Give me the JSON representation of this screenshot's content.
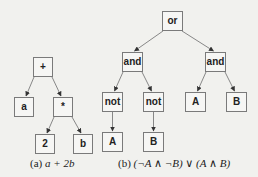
{
  "figure": {
    "subfigures": [
      {
        "id": "a",
        "caption_label": "(a)",
        "caption_expr": "a + 2b",
        "nodes": [
          {
            "id": "plus",
            "label": "+",
            "x": 33,
            "y": 57
          },
          {
            "id": "a",
            "label": "a",
            "x": 14,
            "y": 97
          },
          {
            "id": "mul",
            "label": "*",
            "x": 53,
            "y": 97
          },
          {
            "id": "two",
            "label": "2",
            "x": 35,
            "y": 134
          },
          {
            "id": "b",
            "label": "b",
            "x": 73,
            "y": 134
          }
        ],
        "edges": [
          [
            "plus",
            "a"
          ],
          [
            "plus",
            "mul"
          ],
          [
            "mul",
            "two"
          ],
          [
            "mul",
            "b"
          ]
        ]
      },
      {
        "id": "b",
        "caption_label": "(b)",
        "caption_expr": "(¬A ∧ ¬B) ∨ (A ∧ B)",
        "nodes": [
          {
            "id": "or",
            "label": "or",
            "x": 162,
            "y": 11
          },
          {
            "id": "and1",
            "label": "and",
            "x": 122,
            "y": 52
          },
          {
            "id": "and2",
            "label": "and",
            "x": 205,
            "y": 52
          },
          {
            "id": "not1",
            "label": "not",
            "x": 102,
            "y": 92
          },
          {
            "id": "not2",
            "label": "not",
            "x": 143,
            "y": 92
          },
          {
            "id": "A2",
            "label": "A",
            "x": 185,
            "y": 92
          },
          {
            "id": "B2",
            "label": "B",
            "x": 226,
            "y": 92
          },
          {
            "id": "A1",
            "label": "A",
            "x": 102,
            "y": 132
          },
          {
            "id": "B1",
            "label": "B",
            "x": 143,
            "y": 132
          }
        ],
        "edges": [
          [
            "or",
            "and1"
          ],
          [
            "or",
            "and2"
          ],
          [
            "and1",
            "not1"
          ],
          [
            "and1",
            "not2"
          ],
          [
            "and2",
            "A2"
          ],
          [
            "and2",
            "B2"
          ],
          [
            "not1",
            "A1"
          ],
          [
            "not2",
            "B1"
          ]
        ]
      }
    ],
    "colors": {
      "background": "#f1f1ee",
      "node_fill": "#f6f6f4",
      "node_border": "#7a7a7a",
      "edge": "#7a7a7a",
      "arrowhead": "#333333",
      "text": "#222222"
    }
  }
}
